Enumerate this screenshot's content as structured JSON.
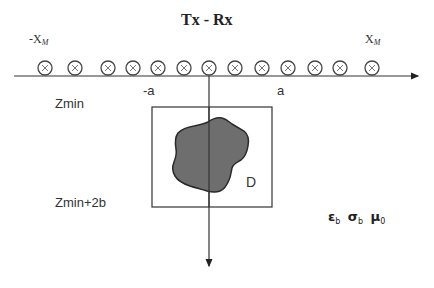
{
  "diagram": {
    "title": "Tx - Rx",
    "axis_labels": {
      "left_limit": {
        "prefix": "-X",
        "subscript": "M"
      },
      "right_limit": {
        "prefix": "X",
        "subscript": "M"
      }
    },
    "antennas": {
      "count": 13,
      "symbol": "circle-with-cross",
      "x_positions": [
        45,
        75,
        108,
        133,
        158,
        184,
        209,
        235,
        262,
        288,
        315,
        340,
        372
      ]
    },
    "domain_bounds": {
      "left": "-a",
      "right": "a",
      "top": "Zmin",
      "bottom": "Zmin+2b"
    },
    "scatterer_label": "D",
    "background_params": [
      {
        "symbol": "ε",
        "subscript": "b"
      },
      {
        "symbol": "σ",
        "subscript": "b"
      },
      {
        "symbol": "μ",
        "subscript": "0"
      }
    ],
    "colors": {
      "line": "#333333",
      "scatterer_fill": "#6e6e6e",
      "scatterer_stroke": "#2a2a2a",
      "background": "#ffffff"
    }
  }
}
